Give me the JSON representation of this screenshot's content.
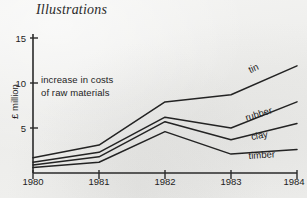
{
  "page": {
    "title": "Illustrations",
    "background_color": "#efefed",
    "ink_color": "#1d1d1d"
  },
  "annotation": {
    "line1": "increase in costs",
    "line2": "of raw materials"
  },
  "axes": {
    "y_label": "£ million",
    "y_ticks": [
      "5",
      "10",
      "15"
    ],
    "x_ticks": [
      "1980",
      "1981",
      "1982",
      "1983",
      "1984"
    ]
  },
  "series_labels": {
    "tin": "tin",
    "rubber": "rubber",
    "clay": "clay",
    "timber": "timber"
  },
  "chart_data": {
    "type": "line",
    "title": "Illustrations",
    "subtitle": "increase in costs of raw materials",
    "xlabel": "",
    "ylabel": "£ million",
    "x": [
      1980,
      1981,
      1982,
      1983,
      1984
    ],
    "categories": [
      "1980",
      "1981",
      "1982",
      "1983",
      "1984"
    ],
    "xlim": [
      1980,
      1984
    ],
    "ylim": [
      0,
      15.5
    ],
    "yticks": [
      5,
      10,
      15
    ],
    "grid": false,
    "legend": "inline-right-end-labels",
    "series": [
      {
        "name": "tin",
        "values": [
          1.7,
          3.1,
          7.9,
          8.7,
          11.9
        ]
      },
      {
        "name": "rubber",
        "values": [
          1.2,
          2.3,
          6.2,
          5.0,
          7.9
        ]
      },
      {
        "name": "clay",
        "values": [
          0.9,
          1.8,
          5.7,
          3.7,
          5.5
        ]
      },
      {
        "name": "timber",
        "values": [
          0.6,
          1.2,
          4.6,
          2.1,
          2.6
        ]
      }
    ],
    "annotations": [
      {
        "text": "increase in costs of raw materials",
        "x": 1980.35,
        "y": 10.5
      }
    ]
  }
}
